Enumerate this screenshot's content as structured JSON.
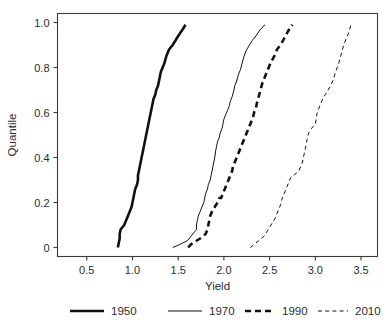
{
  "chart_data": {
    "type": "line",
    "title": "",
    "xlabel": "Yield",
    "ylabel": "Quantile",
    "xlim": [
      0.18,
      3.68
    ],
    "ylim": [
      -0.04,
      1.04
    ],
    "grid": false,
    "legend_position": "bottom",
    "xticks": [
      0.5,
      1.0,
      1.5,
      2.0,
      2.5,
      3.0,
      3.5
    ],
    "xtick_labels": [
      "0.5",
      "1.0",
      "1.5",
      "2.0",
      "2.5",
      "3.0",
      "3.5"
    ],
    "yticks": [
      0,
      0.2,
      0.4,
      0.6,
      0.8,
      1.0
    ],
    "ytick_labels": [
      "0",
      "0.2",
      "0.4",
      "0.6",
      "0.8",
      "1.0"
    ],
    "series": [
      {
        "name": "1950",
        "style": "solid",
        "width": 2.6,
        "color": "#111111",
        "x": [
          0.84,
          0.85,
          0.86,
          0.86,
          0.87,
          0.89,
          0.91,
          0.93,
          0.95,
          0.97,
          0.99,
          1.0,
          1.01,
          1.02,
          1.03,
          1.05,
          1.06,
          1.06,
          1.07,
          1.08,
          1.09,
          1.1,
          1.11,
          1.12,
          1.13,
          1.14,
          1.15,
          1.16,
          1.17,
          1.18,
          1.19,
          1.2,
          1.21,
          1.22,
          1.23,
          1.25,
          1.26,
          1.28,
          1.29,
          1.3,
          1.31,
          1.33,
          1.35,
          1.37,
          1.4,
          1.44,
          1.47,
          1.5,
          1.55,
          1.58
        ],
        "y": [
          0.0,
          0.02,
          0.04,
          0.06,
          0.08,
          0.09,
          0.1,
          0.12,
          0.14,
          0.16,
          0.18,
          0.2,
          0.22,
          0.24,
          0.26,
          0.28,
          0.3,
          0.32,
          0.34,
          0.36,
          0.38,
          0.4,
          0.42,
          0.44,
          0.46,
          0.48,
          0.5,
          0.52,
          0.54,
          0.56,
          0.58,
          0.6,
          0.62,
          0.64,
          0.66,
          0.68,
          0.7,
          0.72,
          0.74,
          0.76,
          0.78,
          0.8,
          0.82,
          0.85,
          0.88,
          0.9,
          0.92,
          0.94,
          0.97,
          0.99
        ]
      },
      {
        "name": "1970",
        "style": "solid",
        "width": 1.0,
        "color": "#222222",
        "x": [
          1.44,
          1.5,
          1.55,
          1.6,
          1.64,
          1.66,
          1.68,
          1.7,
          1.7,
          1.71,
          1.72,
          1.74,
          1.76,
          1.78,
          1.79,
          1.8,
          1.82,
          1.83,
          1.85,
          1.86,
          1.87,
          1.88,
          1.89,
          1.9,
          1.91,
          1.92,
          1.93,
          1.95,
          1.96,
          1.98,
          1.99,
          2.0,
          2.02,
          2.04,
          2.06,
          2.07,
          2.09,
          2.11,
          2.12,
          2.14,
          2.16,
          2.18,
          2.2,
          2.22,
          2.25,
          2.28,
          2.31,
          2.35,
          2.4,
          2.45
        ],
        "y": [
          0.0,
          0.01,
          0.02,
          0.03,
          0.05,
          0.06,
          0.07,
          0.08,
          0.1,
          0.12,
          0.14,
          0.16,
          0.18,
          0.2,
          0.22,
          0.24,
          0.26,
          0.28,
          0.3,
          0.32,
          0.34,
          0.36,
          0.38,
          0.4,
          0.43,
          0.45,
          0.47,
          0.49,
          0.51,
          0.53,
          0.55,
          0.57,
          0.59,
          0.61,
          0.63,
          0.65,
          0.67,
          0.7,
          0.72,
          0.74,
          0.77,
          0.79,
          0.82,
          0.85,
          0.88,
          0.9,
          0.92,
          0.94,
          0.97,
          0.99
        ]
      },
      {
        "name": "1990",
        "style": "dashed",
        "width": 2.6,
        "color": "#111111",
        "x": [
          1.61,
          1.63,
          1.66,
          1.7,
          1.74,
          1.77,
          1.8,
          1.82,
          1.83,
          1.84,
          1.85,
          1.87,
          1.9,
          1.93,
          1.95,
          1.97,
          1.99,
          2.01,
          2.03,
          2.05,
          2.07,
          2.09,
          2.1,
          2.12,
          2.14,
          2.16,
          2.18,
          2.2,
          2.22,
          2.24,
          2.26,
          2.28,
          2.3,
          2.32,
          2.33,
          2.35,
          2.36,
          2.38,
          2.4,
          2.42,
          2.45,
          2.48,
          2.51,
          2.55,
          2.58,
          2.62,
          2.66,
          2.7,
          2.73,
          2.75
        ],
        "y": [
          0.0,
          0.01,
          0.02,
          0.03,
          0.04,
          0.05,
          0.06,
          0.08,
          0.1,
          0.12,
          0.14,
          0.16,
          0.18,
          0.2,
          0.22,
          0.22,
          0.24,
          0.26,
          0.28,
          0.3,
          0.32,
          0.34,
          0.36,
          0.38,
          0.4,
          0.42,
          0.44,
          0.46,
          0.48,
          0.5,
          0.52,
          0.54,
          0.56,
          0.58,
          0.6,
          0.62,
          0.64,
          0.67,
          0.7,
          0.73,
          0.76,
          0.79,
          0.82,
          0.85,
          0.88,
          0.9,
          0.93,
          0.96,
          0.98,
          0.99
        ]
      },
      {
        "name": "2010",
        "style": "dashed",
        "width": 1.0,
        "color": "#222222",
        "x": [
          2.29,
          2.32,
          2.35,
          2.38,
          2.41,
          2.44,
          2.47,
          2.5,
          2.53,
          2.56,
          2.58,
          2.6,
          2.62,
          2.63,
          2.65,
          2.67,
          2.69,
          2.71,
          2.73,
          2.76,
          2.79,
          2.82,
          2.84,
          2.86,
          2.87,
          2.88,
          2.89,
          2.9,
          2.91,
          2.92,
          2.94,
          2.96,
          2.98,
          3.0,
          3.01,
          3.02,
          3.05,
          3.08,
          3.11,
          3.14,
          3.17,
          3.2,
          3.22,
          3.25,
          3.27,
          3.29,
          3.31,
          3.34,
          3.37,
          3.39
        ],
        "y": [
          0.0,
          0.01,
          0.02,
          0.03,
          0.04,
          0.05,
          0.07,
          0.09,
          0.11,
          0.13,
          0.15,
          0.17,
          0.19,
          0.21,
          0.23,
          0.25,
          0.27,
          0.29,
          0.31,
          0.32,
          0.33,
          0.34,
          0.36,
          0.38,
          0.4,
          0.42,
          0.44,
          0.46,
          0.48,
          0.5,
          0.52,
          0.53,
          0.54,
          0.55,
          0.57,
          0.6,
          0.63,
          0.66,
          0.68,
          0.7,
          0.72,
          0.75,
          0.78,
          0.81,
          0.84,
          0.87,
          0.9,
          0.93,
          0.96,
          0.99
        ]
      }
    ],
    "legend": [
      {
        "label": "1950",
        "style": "solid",
        "width": 2.6
      },
      {
        "label": "1970",
        "style": "solid",
        "width": 1.0
      },
      {
        "label": "1990",
        "style": "dashed",
        "width": 2.6
      },
      {
        "label": "2010",
        "style": "dashed",
        "width": 1.0
      }
    ]
  }
}
